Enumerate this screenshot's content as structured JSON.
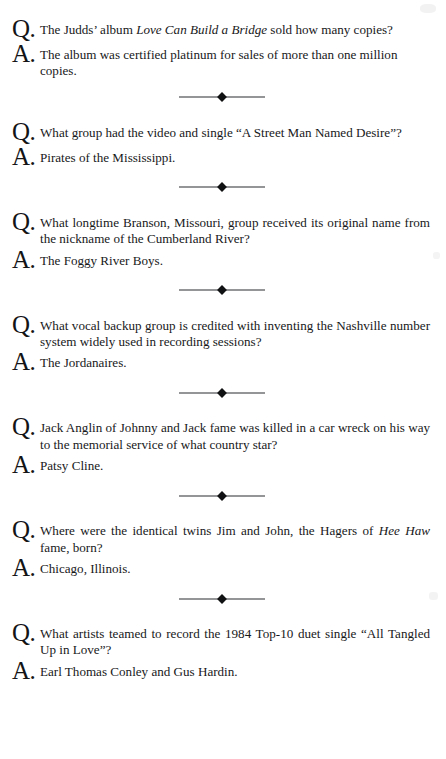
{
  "page": {
    "kind": "scanned-book-page",
    "layout": "question-answer-list",
    "background_color": "#ffffff",
    "text_color": "#17181a",
    "divider_icon": "diamond-rule-ornament"
  },
  "markers": {
    "question": "Q.",
    "answer": "A."
  },
  "entries": [
    {
      "id": 1,
      "question_parts": [
        {
          "text": "The Judds’ album ",
          "italic": false
        },
        {
          "text": "Love Can Build a Bridge",
          "italic": true
        },
        {
          "text": " sold how many copies?",
          "italic": false
        }
      ],
      "question_plain": "The Judds’ album Love Can Build a Bridge sold how many copies?",
      "answer_parts": [
        {
          "text": "The album was certified platinum for sales of more than one million copies.",
          "italic": false
        }
      ],
      "answer_plain": "The album was certified platinum for sales of more than one million copies.",
      "divider_after": true
    },
    {
      "id": 2,
      "question_parts": [
        {
          "text": "What group had the video and single “A Street Man Named Desire”?",
          "italic": false
        }
      ],
      "question_plain": "What group had the video and single “A Street Man Named Desire”?",
      "answer_parts": [
        {
          "text": "Pirates of the Mississippi.",
          "italic": false
        }
      ],
      "answer_plain": "Pirates of the Mississippi.",
      "divider_after": true
    },
    {
      "id": 3,
      "question_parts": [
        {
          "text": "What longtime Branson, Missouri, group received its original name from the nickname of the Cumberland River?",
          "italic": false
        }
      ],
      "question_plain": "What longtime Branson, Missouri, group received its original name from the nickname of the Cumberland River?",
      "answer_parts": [
        {
          "text": "The Foggy River Boys.",
          "italic": false
        }
      ],
      "answer_plain": "The Foggy River Boys.",
      "divider_after": true
    },
    {
      "id": 4,
      "question_parts": [
        {
          "text": "What vocal backup group is credited with inventing the Nashville number system widely used in recording sessions?",
          "italic": false
        }
      ],
      "question_plain": "What vocal backup group is credited with inventing the Nashville number system widely used in recording sessions?",
      "answer_parts": [
        {
          "text": "The Jordanaires.",
          "italic": false
        }
      ],
      "answer_plain": "The Jordanaires.",
      "divider_after": true
    },
    {
      "id": 5,
      "question_parts": [
        {
          "text": "Jack Anglin of Johnny and Jack fame was killed in a car wreck on his way to the memorial service of what country star?",
          "italic": false
        }
      ],
      "question_plain": "Jack Anglin of Johnny and Jack fame was killed in a car wreck on his way to the memorial service of what country star?",
      "answer_parts": [
        {
          "text": "Patsy Cline.",
          "italic": false
        }
      ],
      "answer_plain": "Patsy Cline.",
      "divider_after": true
    },
    {
      "id": 6,
      "question_parts": [
        {
          "text": "Where were the identical twins Jim and John, the Hagers of ",
          "italic": false
        },
        {
          "text": "Hee Haw",
          "italic": true
        },
        {
          "text": " fame, born?",
          "italic": false
        }
      ],
      "question_plain": "Where were the identical twins Jim and John, the Hagers of Hee Haw fame, born?",
      "answer_parts": [
        {
          "text": "Chicago, Illinois.",
          "italic": false
        }
      ],
      "answer_plain": "Chicago, Illinois.",
      "divider_after": true
    },
    {
      "id": 7,
      "question_parts": [
        {
          "text": "What artists teamed to record the 1984 Top-10 duet single “All Tangled Up in Love”?",
          "italic": false
        }
      ],
      "question_plain": "What artists teamed to record the 1984 Top-10 duet single “All Tangled Up in Love”?",
      "answer_parts": [
        {
          "text": "Earl Thomas Conley and Gus Hardin.",
          "italic": false
        }
      ],
      "answer_plain": "Earl Thomas Conley and Gus Hardin.",
      "divider_after": false
    }
  ]
}
